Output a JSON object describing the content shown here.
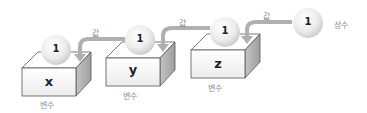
{
  "diagram": {
    "constant": {
      "value": "1",
      "label": "상수"
    },
    "arrow_label": "값",
    "variables": [
      {
        "name": "x",
        "value": "1",
        "label": "변수"
      },
      {
        "name": "y",
        "value": "1",
        "label": "변수"
      },
      {
        "name": "z",
        "value": "1",
        "label": "변수"
      }
    ],
    "arrows": [
      {
        "label": "값",
        "from": "y",
        "to": "x"
      },
      {
        "label": "값",
        "from": "z",
        "to": "y"
      },
      {
        "label": "값",
        "from": "constant",
        "to": "z"
      }
    ],
    "colors": {
      "box_front": "#f4f4f4",
      "box_top": "#ffffff",
      "box_side": "#bdbdbd",
      "arrow": "#a8a8a8",
      "label": "#8a8a8a"
    }
  }
}
